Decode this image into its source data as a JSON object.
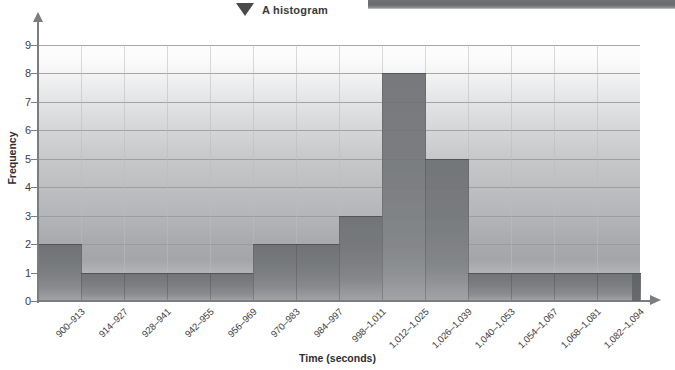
{
  "title": "A histogram",
  "axis": {
    "x_title": "Time (seconds)",
    "y_title": "Frequency"
  },
  "chart_data": {
    "type": "bar",
    "title": "A histogram",
    "xlabel": "Time (seconds)",
    "ylabel": "Frequency",
    "ylim": [
      0,
      9
    ],
    "grid": true,
    "legend": "none",
    "categories": [
      "900–913",
      "914–927",
      "928–941",
      "942–955",
      "956–969",
      "970–983",
      "984–997",
      "998–1,011",
      "1,012–1,025",
      "1,026–1,039",
      "1,040–1,053",
      "1,054–1,067",
      "1,068–1,081",
      "1,082–1,094"
    ],
    "values": [
      2,
      1,
      1,
      1,
      1,
      2,
      2,
      3,
      8,
      5,
      1,
      1,
      1,
      1
    ],
    "ytick_labels": [
      "0",
      "1",
      "2",
      "3",
      "4",
      "5",
      "6",
      "7",
      "8",
      "9"
    ]
  },
  "colors": {
    "bar": "#74767a",
    "axis": "#7b7d80",
    "grid": "#97999c",
    "text": "#3c3c3e"
  }
}
